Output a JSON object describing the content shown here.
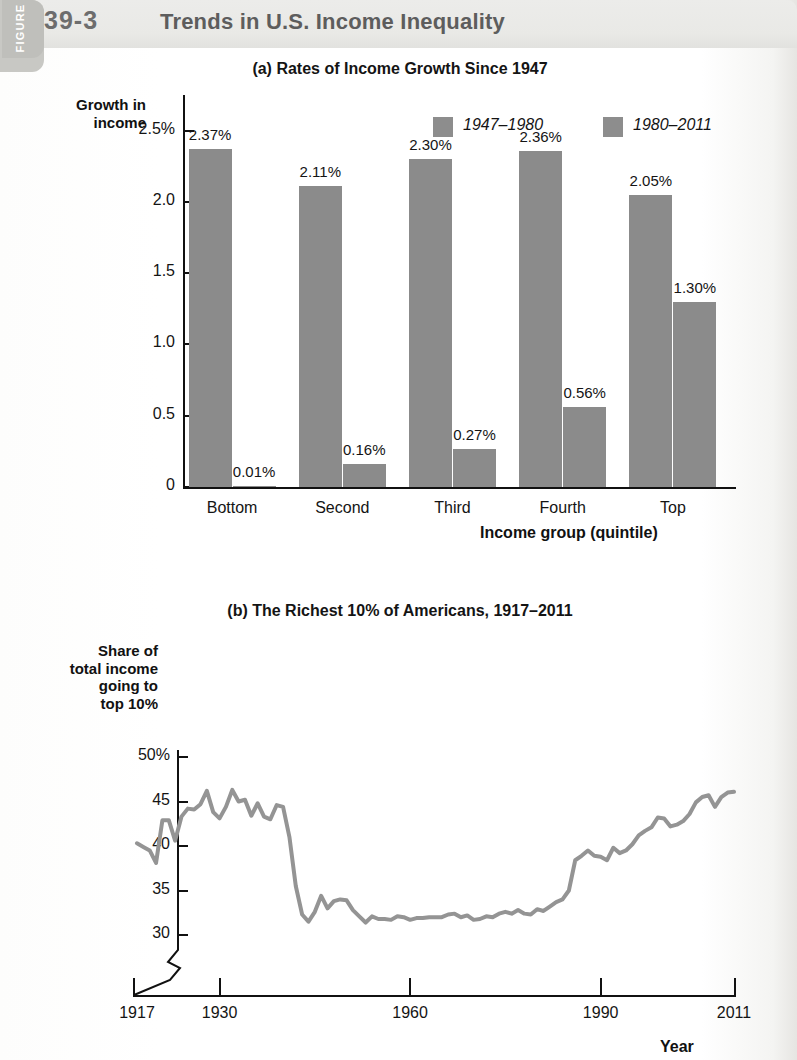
{
  "figure": {
    "tab_word": "FIGURE",
    "number": "39-3",
    "title": "Trends in U.S. Income Inequality"
  },
  "panel_a": {
    "title": "(a) Rates of Income Growth Since 1947",
    "y_axis_label": "Growth in\nincome",
    "x_axis_label": "Income group (quintile)",
    "legend": [
      {
        "label": "1947–1980",
        "color": "#8d8d8d"
      },
      {
        "label": "1980–2011",
        "color": "#8d8d8d"
      }
    ]
  },
  "panel_b": {
    "title": "(b) The Richest 10% of Americans, 1917–2011",
    "y_axis_label": "Share of\ntotal income\ngoing to\ntop 10%",
    "x_axis_label": "Year",
    "line_color": "#949494"
  },
  "chart_data": [
    {
      "type": "bar",
      "title": "(a) Rates of Income Growth Since 1947",
      "xlabel": "Income group (quintile)",
      "ylabel": "Growth in income",
      "categories": [
        "Bottom",
        "Second",
        "Third",
        "Fourth",
        "Top"
      ],
      "series": [
        {
          "name": "1947–1980",
          "values": [
            2.37,
            2.11,
            2.3,
            2.36,
            2.05
          ],
          "labels": [
            "2.37%",
            "2.11%",
            "2.30%",
            "2.36%",
            "2.05%"
          ]
        },
        {
          "name": "1980–2011",
          "values": [
            0.01,
            0.16,
            0.27,
            0.56,
            1.3
          ],
          "labels": [
            "0.01%",
            "0.16%",
            "0.27%",
            "0.56%",
            "1.30%"
          ]
        }
      ],
      "ylim": [
        0,
        2.75
      ],
      "yticks": [
        0,
        0.5,
        1.0,
        1.5,
        2.0,
        2.5
      ],
      "ytick_labels": [
        "0",
        "0.5",
        "1.0",
        "1.5",
        "2.0",
        "2.5%"
      ],
      "grid": false,
      "legend_position": "top-right"
    },
    {
      "type": "line",
      "title": "(b) The Richest 10% of Americans, 1917–2011",
      "xlabel": "Year",
      "ylabel": "Share of total income going to top 10%",
      "ylim": [
        29,
        51
      ],
      "yticks": [
        30,
        35,
        40,
        45,
        50
      ],
      "ytick_labels": [
        "30",
        "35",
        "40",
        "45",
        "50%"
      ],
      "xlim": [
        1917,
        2011
      ],
      "xticks": [
        1917,
        1930,
        1960,
        1990,
        2011
      ],
      "xtick_labels": [
        "1917",
        "1930",
        "1960",
        "1990",
        "2011"
      ],
      "axis_break": true,
      "grid": false,
      "x": [
        1917,
        1918,
        1919,
        1920,
        1921,
        1922,
        1923,
        1924,
        1925,
        1926,
        1927,
        1928,
        1929,
        1930,
        1931,
        1932,
        1933,
        1934,
        1935,
        1936,
        1937,
        1938,
        1939,
        1940,
        1941,
        1942,
        1943,
        1944,
        1945,
        1946,
        1947,
        1948,
        1949,
        1950,
        1951,
        1952,
        1953,
        1954,
        1955,
        1956,
        1957,
        1958,
        1959,
        1960,
        1961,
        1962,
        1963,
        1964,
        1965,
        1966,
        1967,
        1968,
        1969,
        1970,
        1971,
        1972,
        1973,
        1974,
        1975,
        1976,
        1977,
        1978,
        1979,
        1980,
        1981,
        1982,
        1983,
        1984,
        1985,
        1986,
        1987,
        1988,
        1989,
        1990,
        1991,
        1992,
        1993,
        1994,
        1995,
        1996,
        1997,
        1998,
        1999,
        2000,
        2001,
        2002,
        2003,
        2004,
        2005,
        2006,
        2007,
        2008,
        2009,
        2010,
        2011
      ],
      "y": [
        40.3,
        39.9,
        39.5,
        38.1,
        42.9,
        42.9,
        40.6,
        43.3,
        44.2,
        44.1,
        44.7,
        46.2,
        43.8,
        43.1,
        44.4,
        46.3,
        45.0,
        45.2,
        43.4,
        44.8,
        43.3,
        43.0,
        44.6,
        44.4,
        41.0,
        35.5,
        32.3,
        31.5,
        32.6,
        34.4,
        33.0,
        33.8,
        34.0,
        33.9,
        32.8,
        32.1,
        31.4,
        32.1,
        31.8,
        31.8,
        31.7,
        32.1,
        32.0,
        31.7,
        31.9,
        31.9,
        32.0,
        32.0,
        32.0,
        32.3,
        32.4,
        32.0,
        32.2,
        31.7,
        31.8,
        32.1,
        32.0,
        32.4,
        32.6,
        32.4,
        32.8,
        32.4,
        32.3,
        32.9,
        32.7,
        33.2,
        33.7,
        34.0,
        35.0,
        38.4,
        38.9,
        39.5,
        38.9,
        38.8,
        38.4,
        39.8,
        39.2,
        39.5,
        40.2,
        41.2,
        41.7,
        42.1,
        43.2,
        43.1,
        42.2,
        42.4,
        42.8,
        43.6,
        44.9,
        45.5,
        45.7,
        44.4,
        45.5,
        46.0,
        46.1
      ]
    }
  ]
}
